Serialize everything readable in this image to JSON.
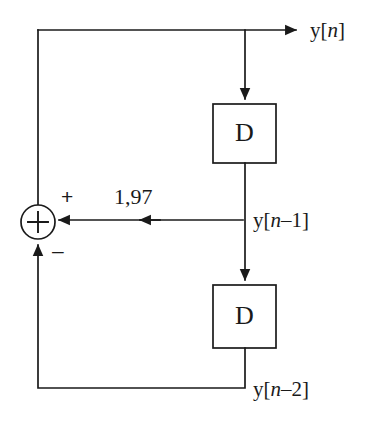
{
  "diagram": {
    "type": "signal-flow-block-diagram",
    "title": "",
    "background_color": "#ffffff",
    "line_color": "#1a1a1a",
    "text_color": "#1a1a1a",
    "blocks": [
      {
        "id": "delay-1",
        "label": "D",
        "name": "delay-block-upper"
      },
      {
        "id": "delay-2",
        "label": "D",
        "name": "delay-block-lower"
      }
    ],
    "adder": {
      "symbol": "+",
      "plus_sign": "+",
      "minus_sign": "–"
    },
    "gain": {
      "value": "1,97"
    },
    "signals": {
      "output": {
        "base": "y[",
        "var": "n",
        "tail": "]"
      },
      "delay_1": {
        "base": "y[",
        "var": "n",
        "tail": "–1]"
      },
      "delay_2": {
        "base": "y[",
        "var": "n",
        "tail": "–2]"
      }
    }
  }
}
